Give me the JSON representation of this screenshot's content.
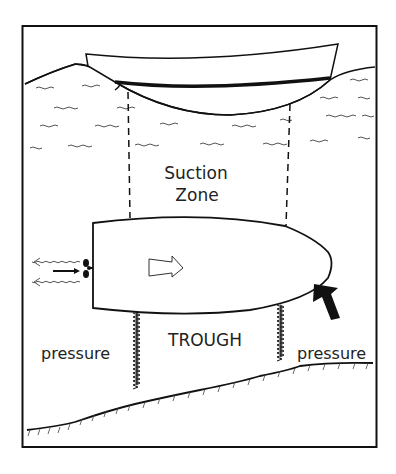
{
  "diagram": {
    "colors": {
      "ink": "#111111",
      "background": "#ffffff",
      "wave": "#555555"
    },
    "labels": {
      "suction_line1": "Suction",
      "suction_line2": "Zone",
      "trough": "TROUGH",
      "pressure_left": "pressure",
      "pressure_right": "pressure"
    },
    "elements": [
      "surface-boat",
      "waterline",
      "suction-zone-dashed-lines",
      "submerged-hull",
      "propeller",
      "direction-arrow",
      "wash-arrows",
      "thrust-arrow",
      "turbulence-marks",
      "sloping-bottom"
    ]
  }
}
